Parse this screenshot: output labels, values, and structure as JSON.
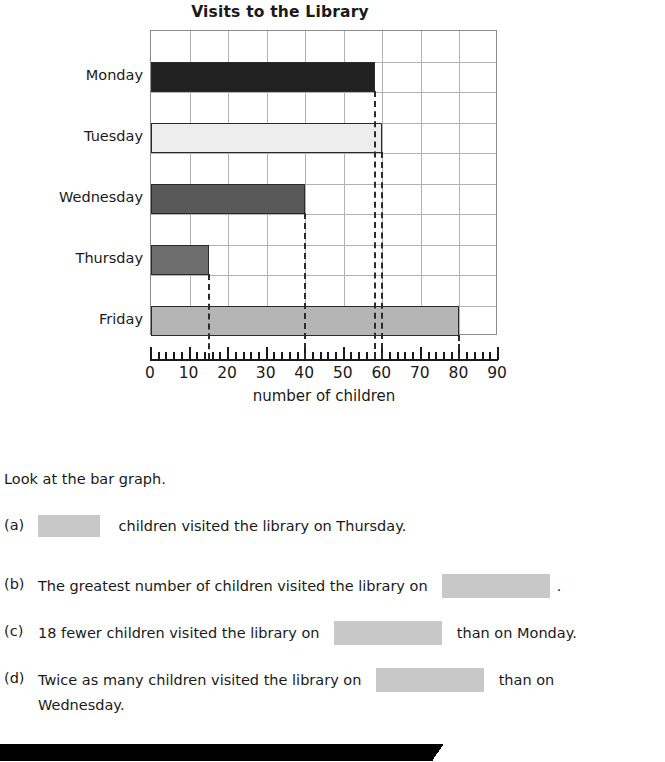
{
  "chart_data": {
    "type": "bar",
    "orientation": "horizontal",
    "title": "Visits to the Library",
    "xlabel": "number of children",
    "ylabel": "",
    "categories": [
      "Monday",
      "Tuesday",
      "Wednesday",
      "Thursday",
      "Friday"
    ],
    "values": [
      58,
      60,
      40,
      15,
      80
    ],
    "series": [
      {
        "name": "number of children",
        "values": [
          58,
          60,
          40,
          15,
          80
        ]
      }
    ],
    "bar_colors": [
      "#212121",
      "#ededed",
      "#595959",
      "#6e6e6e",
      "#b5b5b5"
    ],
    "xlim": [
      0,
      90
    ],
    "major_tick_step": 10,
    "minor_tick_step": 2,
    "tick_labels": [
      "0",
      "10",
      "20",
      "30",
      "40",
      "50",
      "60",
      "70",
      "80",
      "90"
    ],
    "grid": true,
    "legend": false,
    "dashed_guide_values": [
      58,
      60,
      40,
      15,
      80
    ],
    "annotations": []
  },
  "chart": {
    "title": "Visits to the Library",
    "x_axis_title": "number of children"
  },
  "questions": {
    "lead_in": "Look at the bar graph.",
    "items": [
      {
        "label": "(a)",
        "text_before": "",
        "text_after": "children visited the library on Thursday.",
        "blank_size": "small"
      },
      {
        "label": "(b)",
        "text_before": "The greatest number of children visited the library on",
        "text_after": ".",
        "blank_size": "wide"
      },
      {
        "label": "(c)",
        "text_before": "18 fewer children visited the library on",
        "text_after": "than on Monday.",
        "blank_size": "wide"
      },
      {
        "label": "(d)",
        "text_before": "Twice as many children visited the library on",
        "text_after": "than on",
        "text_line2": "Wednesday.",
        "blank_size": "wide"
      }
    ]
  },
  "colors": {
    "blank_fill": "#c8c8c8",
    "grid_line": "#b2b2b2",
    "axis": "#1a1a1a",
    "band": "#000000"
  }
}
